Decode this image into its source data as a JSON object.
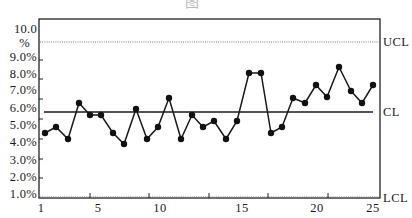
{
  "title_fragment": "图",
  "chart_data": {
    "type": "line",
    "title": "",
    "xlabel": "",
    "ylabel": "",
    "x_tick_labels": [
      "1",
      "5",
      "10",
      "15",
      "20",
      "25"
    ],
    "y_tick_labels": [
      "10.0 %",
      "9.0%",
      "8.0%",
      "7.0%",
      "6.0%",
      "5.0%",
      "4.0%",
      "3.0%",
      "2.0%",
      "1.0%"
    ],
    "ylim": [
      1.0,
      10.0
    ],
    "grid": false,
    "control_limits": {
      "UCL": 9.9,
      "CL": 5.8,
      "LCL": 0.9
    },
    "control_limit_labels": [
      "UCL",
      "CL",
      "LCL"
    ],
    "series": [
      {
        "name": "proportion",
        "x": [
          1,
          2,
          3,
          4,
          5,
          6,
          7,
          8,
          9,
          10,
          11,
          12,
          13,
          14,
          15,
          16,
          17,
          18,
          19,
          20,
          21,
          22,
          23,
          24,
          25,
          26,
          27,
          28,
          29,
          30
        ],
        "values": [
          4.6,
          4.9,
          4.2,
          6.3,
          5.6,
          5.6,
          4.6,
          3.9,
          6.0,
          4.2,
          4.9,
          6.6,
          4.2,
          5.6,
          4.9,
          5.3,
          4.2,
          5.3,
          8.1,
          8.1,
          4.6,
          4.9,
          6.6,
          6.3,
          7.3,
          6.7,
          8.4,
          7.0,
          6.3,
          7.3
        ]
      }
    ]
  },
  "plot": {
    "frame": {
      "x0": 39,
      "y0": 19,
      "x1": 380,
      "y1": 198
    },
    "ucl_y": 42,
    "cl_y": 112,
    "lcl_y": 198,
    "cl_x0": 44,
    "cl_x1": 373,
    "points_px": [
      [
        45,
        133
      ],
      [
        56,
        127
      ],
      [
        68,
        139
      ],
      [
        79,
        103
      ],
      [
        90,
        115
      ],
      [
        101,
        115
      ],
      [
        113,
        133
      ],
      [
        124,
        144
      ],
      [
        136,
        109
      ],
      [
        147,
        139
      ],
      [
        158,
        127
      ],
      [
        169,
        98
      ],
      [
        181,
        139
      ],
      [
        192,
        115
      ],
      [
        203,
        127
      ],
      [
        214,
        121
      ],
      [
        226,
        139
      ],
      [
        237,
        121
      ],
      [
        249,
        73
      ],
      [
        261,
        73
      ],
      [
        271,
        133
      ],
      [
        282,
        127
      ],
      [
        293,
        98
      ],
      [
        305,
        103
      ],
      [
        316,
        85
      ],
      [
        327,
        97
      ],
      [
        339,
        67
      ],
      [
        351,
        91
      ],
      [
        362,
        103
      ],
      [
        373,
        85
      ]
    ],
    "y_ticks_px": [
      60,
      79,
      99,
      119,
      139,
      159,
      178
    ],
    "x_ticks_px": [
      90,
      149,
      209,
      268,
      328
    ],
    "y_label_px": [
      [
        30,
        44
      ],
      [
        58
      ],
      [
        75
      ],
      [
        91
      ],
      [
        109
      ],
      [
        126
      ],
      [
        143
      ],
      [
        161
      ],
      [
        178
      ],
      [
        195
      ]
    ],
    "x_label_px": [
      41,
      98,
      160,
      242,
      317,
      373
    ],
    "right_label_px": [
      42,
      112,
      198
    ]
  },
  "colors": {
    "line": "#1a1a1a",
    "marker": "#111111",
    "dotted": "#777777",
    "frame": "#222222"
  }
}
